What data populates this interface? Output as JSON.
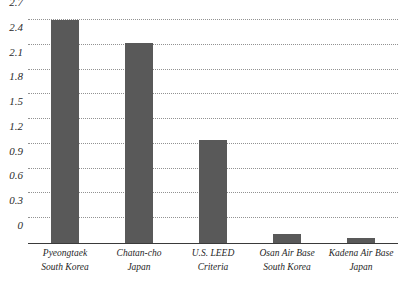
{
  "chart_data": {
    "type": "bar",
    "title": "",
    "subtitle": "",
    "xlabel": "",
    "ylabel": "",
    "ylim": [
      0,
      2.7
    ],
    "grid": true,
    "legend_position": "none",
    "categories": [
      "Pyeongtaek South Korea",
      "Chatan-cho Japan",
      "U.S. LEED Criteria",
      "Osan Air Base South Korea",
      "Kadena Air Base Japan"
    ],
    "category_lines": [
      {
        "line1": "Pyeongtaek",
        "line2": "South Korea"
      },
      {
        "line1": "Chatan-cho",
        "line2": "Japan"
      },
      {
        "line1": "U.S. LEED",
        "line2": "Criteria"
      },
      {
        "line1": "Osan Air Base",
        "line2": "South Korea"
      },
      {
        "line1": "Kadena Air Base",
        "line2": "Japan"
      }
    ],
    "values": [
      2.7,
      2.42,
      1.25,
      0.11,
      0.06
    ],
    "ytick_labels": [
      "0",
      "0.3",
      "0.6",
      "0.9",
      "1.2",
      "1.5",
      "1.8",
      "2.1",
      "2.4",
      "2.7"
    ],
    "ytick_values": [
      0,
      0.3,
      0.6,
      0.9,
      1.2,
      1.5,
      1.8,
      2.1,
      2.4,
      2.7
    ],
    "bar_color": "#595959",
    "gridline_color": "#8d8d8d",
    "axis_color": "#3a3a3a",
    "background_color": "#ffffff"
  }
}
